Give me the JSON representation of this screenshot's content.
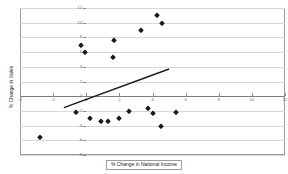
{
  "chart_data": {
    "type": "scatter",
    "title": "",
    "xlabel": "% Change in National Income",
    "ylabel": "% Change in Sales",
    "xlim": [
      -4,
      12
    ],
    "ylim": [
      -8,
      12
    ],
    "xticks": [
      -4,
      -2,
      0,
      2,
      4,
      6,
      8,
      10,
      12
    ],
    "xtick_labels": [
      "-4",
      "-2",
      "0",
      "2",
      "4",
      "6",
      "8",
      "10",
      "12"
    ],
    "yticks": [
      -8,
      -6,
      -4,
      -2,
      0,
      2,
      4,
      6,
      8,
      10,
      12
    ],
    "ytick_labels": [
      "-8",
      "-6",
      "-4",
      "-2",
      "0",
      "2",
      "4",
      "6",
      "8",
      "10",
      "12"
    ],
    "grid": true,
    "grid_axis": "y",
    "legend": "none",
    "marker": "diamond",
    "marker_color": "#1a1a1a",
    "points": [
      {
        "x": -2.8,
        "y": -5.5
      },
      {
        "x": -0.3,
        "y": 7.0
      },
      {
        "x": -0.1,
        "y": 6.0
      },
      {
        "x": 1.6,
        "y": 5.4
      },
      {
        "x": 1.7,
        "y": 7.6
      },
      {
        "x": 3.3,
        "y": 9.0
      },
      {
        "x": 4.3,
        "y": 11.1
      },
      {
        "x": 4.6,
        "y": 9.9
      },
      {
        "x": -0.6,
        "y": -2.2
      },
      {
        "x": 0.2,
        "y": -2.9
      },
      {
        "x": 0.9,
        "y": -3.4
      },
      {
        "x": 1.3,
        "y": -3.4
      },
      {
        "x": 2.0,
        "y": -3.0
      },
      {
        "x": 2.6,
        "y": -2.0
      },
      {
        "x": 3.7,
        "y": -1.6
      },
      {
        "x": 4.0,
        "y": -2.3
      },
      {
        "x": 4.5,
        "y": -4.0
      },
      {
        "x": 5.4,
        "y": -2.1
      }
    ],
    "trendline": {
      "x0": -1.35,
      "y0": -1.55,
      "x1": 5.0,
      "y1": 3.7,
      "color": "#1a1a1a"
    }
  },
  "colors": {
    "frame": "#9a9a9a",
    "gridline": "#d8d8d8",
    "zeroline": "#7d7d7d",
    "tick_text": "#6f6f6f",
    "title_text": "#1a1a1a",
    "background": "#ffffff"
  }
}
